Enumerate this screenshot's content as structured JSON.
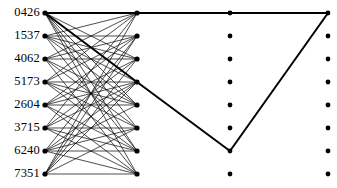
{
  "figure": {
    "kind": "trellis-graph",
    "width": 337,
    "height": 188,
    "background": "#ffffff",
    "ink": "#000000"
  },
  "labels": [
    {
      "text": "0426",
      "y": 13
    },
    {
      "text": "1537",
      "y": 36
    },
    {
      "text": "4062",
      "y": 59
    },
    {
      "text": "5173",
      "y": 82
    },
    {
      "text": "2604",
      "y": 105
    },
    {
      "text": "3715",
      "y": 128
    },
    {
      "text": "6240",
      "y": 151
    },
    {
      "text": "7351",
      "y": 174
    }
  ],
  "columns": [
    {
      "name": "stage-0",
      "x": 45,
      "dot_radius": 2.6
    },
    {
      "name": "stage-1",
      "x": 137,
      "dot_radius": 2.6
    },
    {
      "name": "stage-2",
      "x": 230,
      "dot_radius": 2.4
    },
    {
      "name": "stage-3",
      "x": 328,
      "dot_radius": 2.4
    }
  ],
  "rows_y": [
    13,
    36,
    59,
    82,
    105,
    128,
    151,
    174
  ],
  "edges_stage0_to_stage1": [
    [
      0,
      0
    ],
    [
      0,
      2
    ],
    [
      0,
      4
    ],
    [
      0,
      5
    ],
    [
      0,
      6
    ],
    [
      0,
      7
    ],
    [
      1,
      0
    ],
    [
      1,
      1
    ],
    [
      1,
      2
    ],
    [
      1,
      3
    ],
    [
      1,
      4
    ],
    [
      1,
      6
    ],
    [
      2,
      0
    ],
    [
      2,
      1
    ],
    [
      2,
      2
    ],
    [
      2,
      4
    ],
    [
      2,
      5
    ],
    [
      2,
      7
    ],
    [
      3,
      0
    ],
    [
      3,
      1
    ],
    [
      3,
      3
    ],
    [
      3,
      4
    ],
    [
      3,
      5
    ],
    [
      3,
      6
    ],
    [
      4,
      1
    ],
    [
      4,
      2
    ],
    [
      4,
      3
    ],
    [
      4,
      4
    ],
    [
      4,
      6
    ],
    [
      4,
      7
    ],
    [
      5,
      0
    ],
    [
      5,
      2
    ],
    [
      5,
      3
    ],
    [
      5,
      5
    ],
    [
      5,
      6
    ],
    [
      5,
      7
    ],
    [
      6,
      1
    ],
    [
      6,
      3
    ],
    [
      6,
      4
    ],
    [
      6,
      5
    ],
    [
      6,
      6
    ],
    [
      6,
      7
    ],
    [
      7,
      0
    ],
    [
      7,
      1
    ],
    [
      7,
      2
    ],
    [
      7,
      3
    ],
    [
      7,
      5
    ],
    [
      7,
      7
    ]
  ],
  "thick_edges": [
    {
      "from_col": 0,
      "from_row": 0,
      "to_col": 1,
      "to_row": 0
    },
    {
      "from_col": 0,
      "from_row": 0,
      "to_col": 1,
      "to_row": 3
    },
    {
      "from_col": 1,
      "from_row": 0,
      "to_col": 2,
      "to_row": 0
    },
    {
      "from_col": 2,
      "from_row": 0,
      "to_col": 3,
      "to_row": 0
    },
    {
      "from_col": 1,
      "from_row": 3,
      "to_col": 2,
      "to_row": 6
    },
    {
      "from_col": 2,
      "from_row": 6,
      "to_col": 3,
      "to_row": 0
    }
  ],
  "line_widths": {
    "thin": 0.7,
    "thick": 2.0
  }
}
